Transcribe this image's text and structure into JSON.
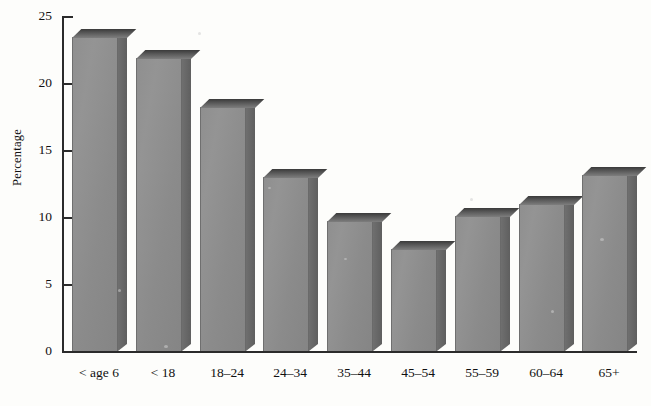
{
  "chart_data": {
    "type": "bar",
    "title": "",
    "xlabel": "",
    "ylabel": "Percentage",
    "categories": [
      "< age 6",
      "< 18",
      "18–24",
      "24–34",
      "35–44",
      "45–54",
      "55–59",
      "60–64",
      "65+"
    ],
    "values": [
      23.4,
      21.9,
      18.2,
      13.0,
      9.7,
      7.6,
      10.1,
      11.0,
      13.1
    ],
    "ylim": [
      0,
      25
    ],
    "yticks": [
      0,
      5,
      10,
      15,
      20,
      25
    ],
    "ytick_labels": [
      "0",
      "5",
      "10",
      "15",
      "20",
      "25"
    ],
    "grid": false,
    "legend": "none",
    "bar_style": "3d-block",
    "colors": {
      "bar_front": "#8f8f8f",
      "bar_side": "#696969",
      "bar_top": "#585858",
      "axis": "#2b2b2b",
      "background": "#fdfdfb",
      "text": "#111111"
    }
  }
}
